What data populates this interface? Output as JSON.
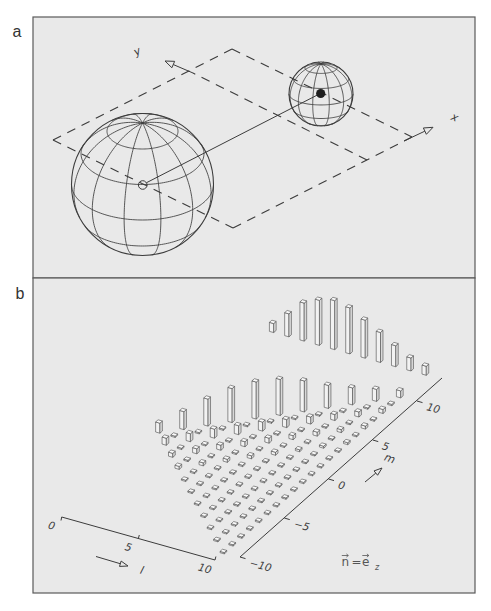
{
  "figure": {
    "panel_a": {
      "label": "a",
      "x_axis_label": "x",
      "y_axis_label": "y",
      "large_sphere": {
        "center_marker": "open-circle",
        "meridians": 12,
        "parallels_deg": [
          -60,
          -30,
          0,
          30,
          60
        ]
      },
      "small_sphere": {
        "center_marker": "filled-dot",
        "meridians": 12,
        "parallels_deg": [
          -60,
          -30,
          0,
          30,
          60
        ]
      }
    },
    "panel_b": {
      "label": "b",
      "l_axis": {
        "label": "l",
        "ticks": [
          "0",
          "5",
          "10"
        ]
      },
      "m_axis": {
        "label": "m",
        "ticks": [
          "−10",
          "−5",
          "0",
          "5",
          "10"
        ]
      },
      "annotation": {
        "lhs": "n",
        "eq": "=",
        "rhs": "e",
        "subscript": "z"
      }
    }
  },
  "colors": {
    "page_background": "#ffffff",
    "panel_background": "#e9e9e9",
    "frame": "#5a5a5a",
    "line": "#3c3c3c",
    "bar_edge": "#4a4a4a",
    "bar_front": "#f2f2f2",
    "bar_side": "#d8d8d8",
    "bar_top": "#fafafa",
    "center_dot": "#1e1e1e"
  },
  "chart_data": {
    "type": "bar",
    "subtype": "3d-histogram",
    "title": "",
    "xlabel": "l",
    "ylabel": "m",
    "zlabel": "",
    "xlim": [
      0,
      10
    ],
    "ylim": [
      -10,
      10
    ],
    "x_ticks": [
      "0",
      "5",
      "10"
    ],
    "y_ticks": [
      "−10",
      "−5",
      "0",
      "5",
      "10"
    ],
    "grid_lines": false,
    "legend": null,
    "annotations": [
      "n⃗ = e⃗_z"
    ],
    "value_scale": "relative bar height (arbitrary units, no vertical axis shown)",
    "domain": "0 ≤ l ≤ 10, −l ≤ m ≤ l",
    "grid": [
      {
        "l": 0,
        "m_range": [
          0,
          0
        ],
        "values": [
          10
        ]
      },
      {
        "l": 1,
        "m_range": [
          -1,
          1
        ],
        "values": [
          7,
          0,
          18
        ]
      },
      {
        "l": 2,
        "m_range": [
          -2,
          2
        ],
        "values": [
          4,
          0,
          8,
          0,
          27
        ]
      },
      {
        "l": 3,
        "m_range": [
          -3,
          3
        ],
        "values": [
          3,
          0,
          5,
          0,
          9,
          0,
          34
        ]
      },
      {
        "l": 4,
        "m_range": [
          -4,
          4
        ],
        "values": [
          1,
          0,
          3,
          0,
          5,
          0,
          9,
          0,
          37
        ]
      },
      {
        "l": 5,
        "m_range": [
          -5,
          5
        ],
        "values": [
          0,
          0,
          1,
          0,
          3,
          0,
          5,
          0,
          9,
          0,
          36
        ]
      },
      {
        "l": 6,
        "m_range": [
          -6,
          6
        ],
        "values": [
          0,
          0,
          0,
          0,
          1,
          0,
          3,
          0,
          5,
          0,
          8,
          0,
          31
        ]
      },
      {
        "l": 7,
        "m_range": [
          -7,
          7
        ],
        "values": [
          0,
          0,
          0,
          0,
          0,
          0,
          1,
          0,
          3,
          0,
          4,
          0,
          7,
          0,
          23
        ]
      },
      {
        "l": 8,
        "m_range": [
          -8,
          8
        ],
        "values": [
          0,
          0,
          0,
          0,
          0,
          0,
          0,
          0,
          1,
          0,
          2,
          0,
          4,
          0,
          6,
          0,
          17
        ]
      },
      {
        "l": 9,
        "m_range": [
          -9,
          9
        ],
        "values": [
          0,
          0,
          0,
          0,
          0,
          0,
          0,
          0,
          0,
          0,
          1,
          0,
          2,
          0,
          3,
          0,
          5,
          0,
          12
        ]
      },
      {
        "l": 10,
        "m_range": [
          -10,
          10
        ],
        "values": [
          0,
          0,
          0,
          0,
          0,
          0,
          0,
          0,
          0,
          0,
          0,
          0,
          1,
          0,
          2,
          0,
          3,
          0,
          4,
          0,
          7
        ]
      }
    ],
    "back_row": {
      "l": [
        0,
        1,
        2,
        3,
        4,
        5,
        6,
        7,
        8,
        9,
        10
      ],
      "values": [
        9,
        23,
        38,
        45,
        49,
        46,
        38,
        30,
        21,
        13,
        9
      ]
    }
  }
}
